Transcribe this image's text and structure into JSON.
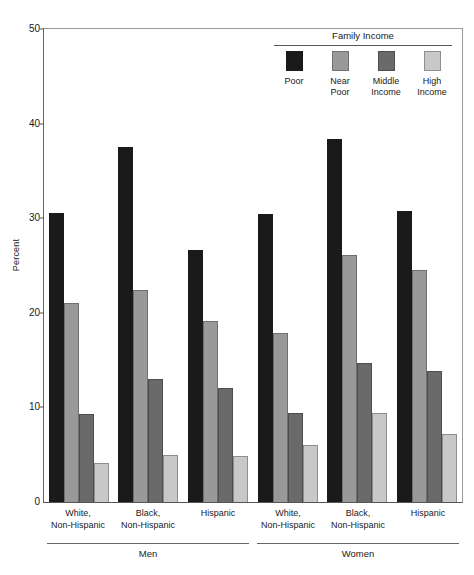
{
  "chart_data": {
    "type": "bar",
    "title": "",
    "xlabel": "",
    "ylabel": "Percent",
    "ylim": [
      0,
      50
    ],
    "yticks": [
      0,
      10,
      20,
      30,
      40,
      50
    ],
    "ytick_labels": [
      "0",
      "10",
      "20",
      "30",
      "40",
      "50"
    ],
    "grid": false,
    "legend_position": "top-right",
    "legend_title": "Family Income",
    "categories": [
      "Men / White, Non-Hispanic",
      "Men / Black, Non-Hispanic",
      "Men / Hispanic",
      "Women / White, Non-Hispanic",
      "Women / Black, Non-Hispanic",
      "Women / Hispanic"
    ],
    "series": [
      {
        "name": "Poor",
        "color": "#1a1a1a",
        "values": [
          30.5,
          37.5,
          26.6,
          30.4,
          38.4,
          30.8
        ]
      },
      {
        "name": "Near Poor",
        "color": "#999999",
        "values": [
          21.0,
          22.4,
          19.1,
          17.9,
          26.1,
          24.5
        ]
      },
      {
        "name": "Middle Income",
        "color": "#6a6a6a",
        "values": [
          9.3,
          13.0,
          12.0,
          9.4,
          14.7,
          13.8
        ]
      },
      {
        "name": "High Income",
        "color": "#c8c8c8",
        "values": [
          4.1,
          5.0,
          4.9,
          6.0,
          9.4,
          7.2
        ]
      }
    ]
  },
  "axis": {
    "y_label": "Percent",
    "y_ticks": [
      "50",
      "40",
      "30",
      "20",
      "10",
      "0"
    ]
  },
  "legend": {
    "title": "Family Income",
    "items": [
      {
        "label": "Poor",
        "key": "poor"
      },
      {
        "label": "Near\nPoor",
        "key": "near-poor"
      },
      {
        "label": "Middle\nIncome",
        "key": "middle"
      },
      {
        "label": "High\nIncome",
        "key": "high"
      }
    ]
  },
  "x_axis": {
    "sex_groups": [
      {
        "label": "Men",
        "races": [
          {
            "label": "White,\nNon-Hispanic",
            "bars": [
              {
                "series": "Poor",
                "key": "poor",
                "value": 30.5
              },
              {
                "series": "Near Poor",
                "key": "near-poor",
                "value": 21.0
              },
              {
                "series": "Middle Income",
                "key": "middle",
                "value": 9.3
              },
              {
                "series": "High Income",
                "key": "high",
                "value": 4.1
              }
            ]
          },
          {
            "label": "Black,\nNon-Hispanic",
            "bars": [
              {
                "series": "Poor",
                "key": "poor",
                "value": 37.5
              },
              {
                "series": "Near Poor",
                "key": "near-poor",
                "value": 22.4
              },
              {
                "series": "Middle Income",
                "key": "middle",
                "value": 13.0
              },
              {
                "series": "High Income",
                "key": "high",
                "value": 5.0
              }
            ]
          },
          {
            "label": "Hispanic",
            "bars": [
              {
                "series": "Poor",
                "key": "poor",
                "value": 26.6
              },
              {
                "series": "Near Poor",
                "key": "near-poor",
                "value": 19.1
              },
              {
                "series": "Middle Income",
                "key": "middle",
                "value": 12.0
              },
              {
                "series": "High Income",
                "key": "high",
                "value": 4.9
              }
            ]
          }
        ]
      },
      {
        "label": "Women",
        "races": [
          {
            "label": "White,\nNon-Hispanic",
            "bars": [
              {
                "series": "Poor",
                "key": "poor",
                "value": 30.4
              },
              {
                "series": "Near Poor",
                "key": "near-poor",
                "value": 17.9
              },
              {
                "series": "Middle Income",
                "key": "middle",
                "value": 9.4
              },
              {
                "series": "High Income",
                "key": "high",
                "value": 6.0
              }
            ]
          },
          {
            "label": "Black,\nNon-Hispanic",
            "bars": [
              {
                "series": "Poor",
                "key": "poor",
                "value": 38.4
              },
              {
                "series": "Near Poor",
                "key": "near-poor",
                "value": 26.1
              },
              {
                "series": "Middle Income",
                "key": "middle",
                "value": 14.7
              },
              {
                "series": "High Income",
                "key": "high",
                "value": 9.4
              }
            ]
          },
          {
            "label": "Hispanic",
            "bars": [
              {
                "series": "Poor",
                "key": "poor",
                "value": 30.8
              },
              {
                "series": "Near Poor",
                "key": "near-poor",
                "value": 24.5
              },
              {
                "series": "Middle Income",
                "key": "middle",
                "value": 13.8
              },
              {
                "series": "High Income",
                "key": "high",
                "value": 7.2
              }
            ]
          }
        ]
      }
    ]
  }
}
